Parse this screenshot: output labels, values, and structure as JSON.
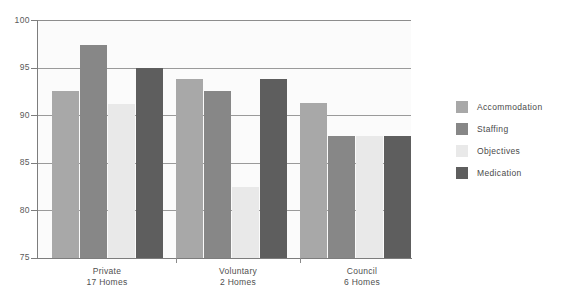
{
  "chart_data": {
    "type": "bar",
    "title": "",
    "subtitle": "",
    "xlabel": "",
    "ylabel": "",
    "ylim": [
      75,
      100
    ],
    "yticks": [
      75,
      80,
      85,
      90,
      95,
      100
    ],
    "ytick_labels": [
      "75",
      "80",
      "85",
      "90",
      "95",
      "100"
    ],
    "grid": "horizontal",
    "legend_position": "right",
    "categories": [
      "Private",
      "Voluntary",
      "Council"
    ],
    "category_sublabels": [
      "17 Homes",
      "2 Homes",
      "6 Homes"
    ],
    "series": [
      {
        "name": "Accommodation",
        "color": "#a8a8a8",
        "values": [
          92.5,
          93.8,
          91.3
        ]
      },
      {
        "name": "Staffing",
        "color": "#878787",
        "values": [
          97.4,
          92.5,
          87.8
        ]
      },
      {
        "name": "Objectives",
        "color": "#e9e9e9",
        "values": [
          91.2,
          82.5,
          87.8
        ]
      },
      {
        "name": "Medication",
        "color": "#5e5e5e",
        "values": [
          95.0,
          93.8,
          87.8
        ]
      }
    ]
  },
  "axis": {
    "y_labels": [
      "100",
      "95",
      "90",
      "85",
      "80",
      "75"
    ]
  },
  "legend": {
    "items": [
      {
        "label": "Accommodation"
      },
      {
        "label": "Staffing"
      },
      {
        "label": "Objectives"
      },
      {
        "label": "Medication"
      }
    ]
  }
}
